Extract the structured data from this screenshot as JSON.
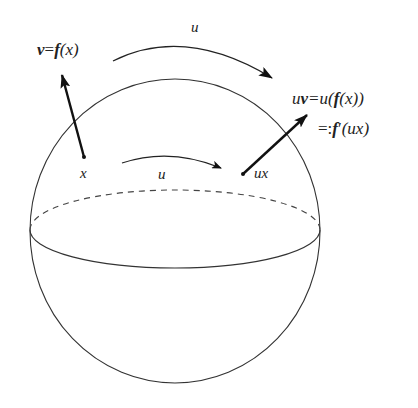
{
  "diagram": {
    "type": "sphere-group-action",
    "colors": {
      "stroke": "#333333",
      "arrow": "#111111",
      "text": "#222222",
      "background": "#ffffff"
    },
    "sphere": {
      "center": [
        175,
        231
      ],
      "rx": 145,
      "ry": 152,
      "equator": {
        "cy": 229,
        "rx": 145,
        "ry_front": 39,
        "ry_back": 39,
        "back_style": "dashed"
      }
    },
    "points": [
      {
        "id": "x",
        "label": "x",
        "pos": [
          84,
          157
        ],
        "label_pos": [
          85,
          178
        ]
      },
      {
        "id": "ux",
        "label": "ux",
        "pos": [
          243,
          174
        ],
        "label_pos": [
          255,
          178
        ]
      }
    ],
    "vectors": [
      {
        "id": "v",
        "from": [
          84,
          157
        ],
        "to": [
          62,
          75
        ]
      },
      {
        "id": "uv",
        "from": [
          243,
          174
        ],
        "to": [
          307,
          115
        ]
      }
    ],
    "action_arrows": [
      {
        "id": "outer-u",
        "label": "u",
        "label_pos": [
          191,
          32
        ]
      },
      {
        "id": "inner-u",
        "label": "u",
        "label_pos": [
          158,
          179
        ]
      }
    ],
    "labels": {
      "v_def": {
        "v": "v",
        "eq": "=",
        "f": "f",
        "rest": "(x)"
      },
      "uv_def": {
        "u": "u",
        "v": "v",
        "eq": "=u(",
        "f": "f",
        "rest": "(x))"
      },
      "fprime_def": {
        "eq": "=:",
        "f": "f",
        "prime": "′",
        "rest": "(ux)"
      }
    }
  }
}
